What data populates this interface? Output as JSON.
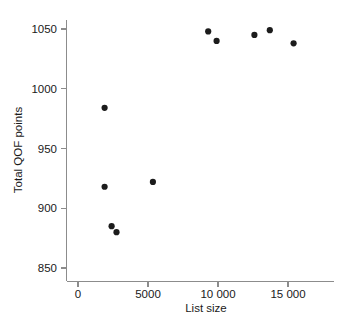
{
  "chart_data": {
    "type": "scatter",
    "title": "",
    "xlabel": "List size",
    "ylabel": "Total QOF points",
    "xlim": [
      0,
      16500
    ],
    "ylim": [
      845,
      1058
    ],
    "grid": false,
    "legend": null,
    "x_ticks": [
      0,
      5000,
      10000,
      15000
    ],
    "x_tick_labels": [
      "0",
      "5000",
      "10 000",
      "15 000"
    ],
    "y_ticks": [
      850,
      900,
      950,
      1000,
      1050
    ],
    "y_tick_labels": [
      "850",
      "900",
      "950",
      "1000",
      "1050"
    ],
    "marker": {
      "shape": "circle",
      "color": "#1c1c1c",
      "size": 3.1
    },
    "series": [
      {
        "name": "practices",
        "points": [
          {
            "x": 1900,
            "y": 984
          },
          {
            "x": 1900,
            "y": 918
          },
          {
            "x": 2400,
            "y": 885
          },
          {
            "x": 2750,
            "y": 880
          },
          {
            "x": 5350,
            "y": 922
          },
          {
            "x": 9300,
            "y": 1048
          },
          {
            "x": 9900,
            "y": 1040
          },
          {
            "x": 12600,
            "y": 1045
          },
          {
            "x": 13700,
            "y": 1049
          },
          {
            "x": 15400,
            "y": 1038
          }
        ]
      }
    ]
  },
  "axes": {
    "x_axis_title": "List size",
    "y_axis_title": "Total QOF points"
  },
  "colors": {
    "axis": "#8c8c8c",
    "text": "#1a1a1a",
    "point": "#1c1c1c",
    "background": "#ffffff"
  }
}
